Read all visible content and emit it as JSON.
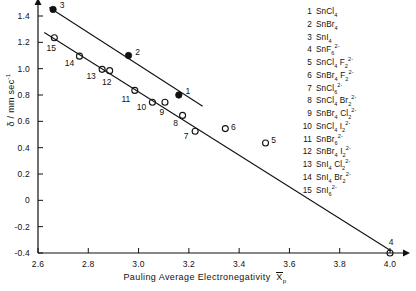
{
  "chart_data": {
    "type": "scatter",
    "title": "",
    "xlabel": "Pauling Average Electronegativity  X̄p",
    "ylabel": "δ / mm sec⁻¹",
    "xlim": [
      2.6,
      4.0
    ],
    "ylim": [
      -0.4,
      1.5
    ],
    "grid": false,
    "legend_position": "right",
    "xticks": [
      "2.6",
      "2.8",
      "3.0",
      "3.2",
      "3.4",
      "3.6",
      "3.8",
      "4.0"
    ],
    "xtick_values": [
      2.6,
      2.8,
      3.0,
      3.2,
      3.4,
      3.6,
      3.8,
      4.0
    ],
    "yticks": [
      "1.4",
      "1.2",
      "1.0",
      "0.8",
      "0.6",
      "0.4",
      "0.2",
      "0",
      "-0.2",
      "-0.4"
    ],
    "ytick_values": [
      1.4,
      1.2,
      1.0,
      0.8,
      0.6,
      0.4,
      0.2,
      0.0,
      -0.2,
      -0.4
    ],
    "series": [
      {
        "name": "SnX4 tetrahalides (filled circles)",
        "marker": "filled-circle",
        "points": [
          {
            "id": "3",
            "label": "3",
            "x": 2.66,
            "y": 1.45,
            "label_dx": 9,
            "label_dy": -4
          },
          {
            "id": "2",
            "label": "2",
            "x": 2.96,
            "y": 1.1,
            "label_dx": 9,
            "label_dy": -4
          },
          {
            "id": "1",
            "label": "1",
            "x": 3.16,
            "y": 0.8,
            "label_dx": 9,
            "label_dy": -4
          }
        ]
      },
      {
        "name": "SnX6 2- hexahalide anions (open circles)",
        "marker": "open-circle",
        "points": [
          {
            "id": "15",
            "label": "15",
            "x": 2.665,
            "y": 1.235,
            "label_dx": -3,
            "label_dy": 10
          },
          {
            "id": "14",
            "label": "14",
            "x": 2.765,
            "y": 1.095,
            "label_dx": -10,
            "label_dy": 7
          },
          {
            "id": "13",
            "label": "13",
            "x": 2.855,
            "y": 0.995,
            "label_dx": -11,
            "label_dy": 7
          },
          {
            "id": "12",
            "label": "12",
            "x": 2.885,
            "y": 0.985,
            "label_dx": -3,
            "label_dy": 11
          },
          {
            "id": "11",
            "label": "11",
            "x": 2.985,
            "y": 0.835,
            "label_dx": -9,
            "label_dy": 9
          },
          {
            "id": "10",
            "label": "10",
            "x": 3.055,
            "y": 0.745,
            "label_dx": -11,
            "label_dy": 5
          },
          {
            "id": "9",
            "label": "9",
            "x": 3.105,
            "y": 0.745,
            "label_dx": -3,
            "label_dy": 10
          },
          {
            "id": "8",
            "label": "8",
            "x": 3.175,
            "y": 0.645,
            "label_dx": -7,
            "label_dy": 8
          },
          {
            "id": "7",
            "label": "7",
            "x": 3.225,
            "y": 0.525,
            "label_dx": -9,
            "label_dy": 5
          },
          {
            "id": "6",
            "label": "6",
            "x": 3.345,
            "y": 0.545,
            "label_dx": 8,
            "label_dy": -2
          },
          {
            "id": "5",
            "label": "5",
            "x": 3.505,
            "y": 0.435,
            "label_dx": 8,
            "label_dy": -3
          },
          {
            "id": "4",
            "label": "4",
            "x": 4.0,
            "y": -0.4,
            "label_dx": 1,
            "label_dy": -11
          }
        ]
      }
    ],
    "trendlines": [
      {
        "name": "upper-line-tetrahalides",
        "x1": 2.645,
        "y1": 1.465,
        "x2": 3.255,
        "y2": 0.715
      },
      {
        "name": "lower-line-hexahaloanions",
        "x1": 2.625,
        "y1": 1.275,
        "x2": 4.005,
        "y2": -0.385
      }
    ]
  },
  "axes": {
    "x_title_main": "Pauling  Average  Electronegativity",
    "x_title_symbol": "X",
    "x_title_subscript": "p",
    "y_title_symbol": "δ",
    "y_title_units": "/ mm sec",
    "y_title_exponent": "-1"
  },
  "legend": {
    "items": [
      {
        "num": "1",
        "element": "SnCl",
        "sub1": "4",
        "sup1": "",
        "element2": "",
        "sub2": "",
        "sup2": ""
      },
      {
        "num": "2",
        "element": "SnBr",
        "sub1": "4",
        "sup1": "",
        "element2": "",
        "sub2": "",
        "sup2": ""
      },
      {
        "num": "3",
        "element": "SnI",
        "sub1": "4",
        "sup1": "",
        "element2": "",
        "sub2": "",
        "sup2": ""
      },
      {
        "num": "4",
        "element": "SnF",
        "sub1": "6",
        "sup1": "2-",
        "element2": "",
        "sub2": "",
        "sup2": ""
      },
      {
        "num": "5",
        "element": "SnCl",
        "sub1": "4",
        "sup1": "",
        "element2": "F",
        "sub2": "2",
        "sup2": "2-"
      },
      {
        "num": "6",
        "element": "SnBr",
        "sub1": "4",
        "sup1": "",
        "element2": "F",
        "sub2": "2",
        "sup2": "2-"
      },
      {
        "num": "7",
        "element": "SnCl",
        "sub1": "6",
        "sup1": "2-",
        "element2": "",
        "sub2": "",
        "sup2": ""
      },
      {
        "num": "8",
        "element": "SnCl",
        "sub1": "4",
        "sup1": "",
        "element2": "Br",
        "sub2": "2",
        "sup2": "2-"
      },
      {
        "num": "9",
        "element": "SnBr",
        "sub1": "4",
        "sup1": "",
        "element2": "Cl",
        "sub2": "2",
        "sup2": "2-"
      },
      {
        "num": "10",
        "element": "SnCl",
        "sub1": "4",
        "sup1": "",
        "element2": "I",
        "sub2": "2",
        "sup2": "2-"
      },
      {
        "num": "11",
        "element": "SnBr",
        "sub1": "6",
        "sup1": "2-",
        "element2": "",
        "sub2": "",
        "sup2": ""
      },
      {
        "num": "12",
        "element": "SnBr",
        "sub1": "4",
        "sup1": "",
        "element2": "I",
        "sub2": "2",
        "sup2": "2-"
      },
      {
        "num": "13",
        "element": "SnI",
        "sub1": "4",
        "sup1": "",
        "element2": "Cl",
        "sub2": "2",
        "sup2": "2-"
      },
      {
        "num": "14",
        "element": "SnI",
        "sub1": "4",
        "sup1": "",
        "element2": "Br",
        "sub2": "2",
        "sup2": "2-"
      },
      {
        "num": "15",
        "element": "SnI",
        "sub1": "6",
        "sup1": "2-",
        "element2": "",
        "sub2": "",
        "sup2": ""
      }
    ]
  },
  "colors": {
    "axis": "#111111",
    "marker": "#111111",
    "background": "#ffffff"
  }
}
